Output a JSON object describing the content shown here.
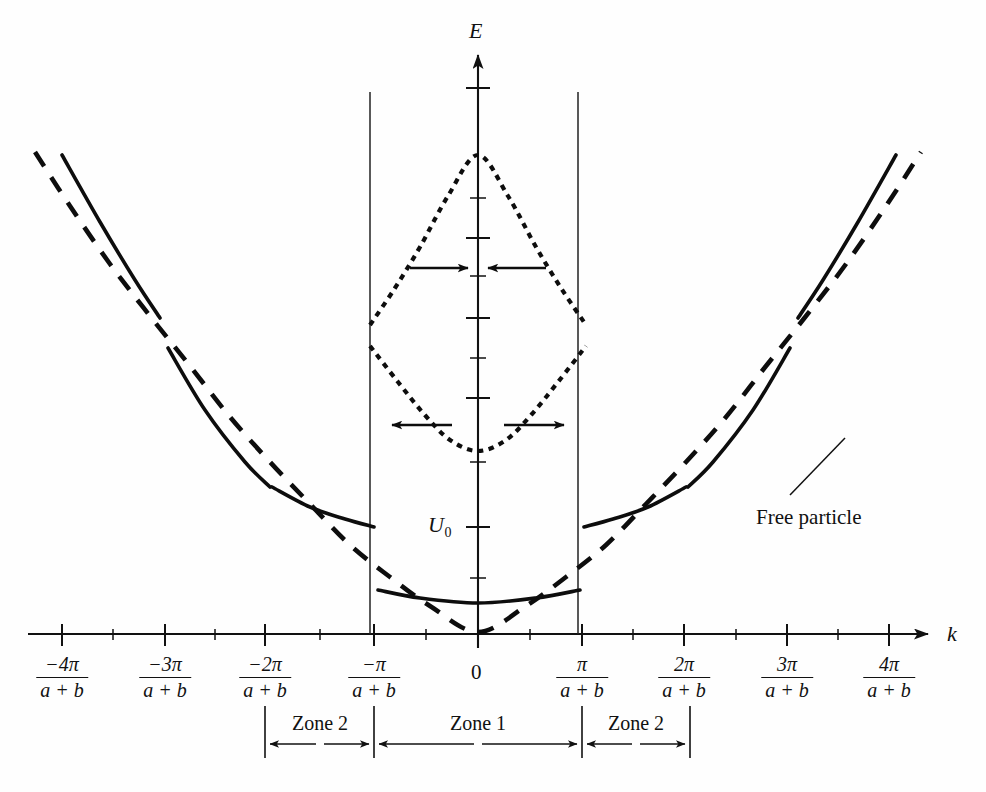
{
  "figure": {
    "kind": "energy-band-diagram",
    "background_color": "#fefefe",
    "ink_color": "#0d0d0d"
  },
  "axes": {
    "y_label": "E",
    "x_label": "k",
    "origin_label": "0",
    "energy_reference_label": "U",
    "energy_reference_subscript": "0"
  },
  "x_ticks": [
    {
      "numerator": "−4π",
      "denominator": "a + b",
      "x": 62
    },
    {
      "numerator": "−3π",
      "denominator": "a + b",
      "x": 165
    },
    {
      "numerator": "−2π",
      "denominator": "a + b",
      "x": 265
    },
    {
      "numerator": "−π",
      "denominator": "a + b",
      "x": 374
    },
    {
      "numerator": "π",
      "denominator": "a + b",
      "x": 582
    },
    {
      "numerator": "2π",
      "denominator": "a + b",
      "x": 684
    },
    {
      "numerator": "3π",
      "denominator": "a + b",
      "x": 787
    },
    {
      "numerator": "4π",
      "denominator": "a + b",
      "x": 889
    }
  ],
  "zones": [
    {
      "label": "Zone 2",
      "start_x": 265,
      "end_x": 374,
      "center_x": 320
    },
    {
      "label": "Zone 1",
      "start_x": 374,
      "end_x": 582,
      "center_x": 478
    },
    {
      "label": "Zone 2",
      "start_x": 582,
      "end_x": 690,
      "center_x": 636
    }
  ],
  "annotations": {
    "free_particle_label": "Free particle",
    "free_particle_label_x": 756,
    "free_particle_label_y": 505,
    "leader_from_x": 790,
    "leader_from_y": 495,
    "leader_to_x": 845,
    "leader_to_y": 438
  },
  "chart_data": {
    "type": "line",
    "title": "",
    "xlabel": "k",
    "ylabel": "E",
    "grid": false,
    "legend": "none",
    "xlim_labels": [
      "-4π/(a+b)",
      "4π/(a+b)"
    ],
    "series": [
      {
        "name": "free-particle-parabola",
        "style": "long-dashed",
        "points": [
          [
            35,
            152
          ],
          [
            70,
            206
          ],
          [
            110,
            264
          ],
          [
            150,
            316
          ],
          [
            190,
            366
          ],
          [
            230,
            417
          ],
          [
            270,
            462
          ],
          [
            310,
            504
          ],
          [
            350,
            545
          ],
          [
            390,
            577
          ],
          [
            430,
            606
          ],
          [
            478,
            632
          ],
          [
            526,
            606
          ],
          [
            566,
            577
          ],
          [
            606,
            545
          ],
          [
            646,
            504
          ],
          [
            686,
            462
          ],
          [
            726,
            417
          ],
          [
            766,
            366
          ],
          [
            806,
            316
          ],
          [
            846,
            264
          ],
          [
            886,
            206
          ],
          [
            921,
            152
          ]
        ]
      },
      {
        "name": "band-3-left",
        "style": "solid",
        "points": [
          [
            62,
            155
          ],
          [
            100,
            222
          ],
          [
            135,
            280
          ],
          [
            160,
            318
          ]
        ]
      },
      {
        "name": "band-2-left",
        "style": "solid",
        "points": [
          [
            168,
            348
          ],
          [
            205,
            410
          ],
          [
            245,
            462
          ],
          [
            270,
            487
          ]
        ]
      },
      {
        "name": "band-1-left",
        "style": "solid",
        "points": [
          [
            272,
            487
          ],
          [
            310,
            507
          ],
          [
            345,
            519
          ],
          [
            374,
            527
          ]
        ]
      },
      {
        "name": "band-0-zone1",
        "style": "solid",
        "points": [
          [
            378,
            590
          ],
          [
            420,
            598
          ],
          [
            478,
            603
          ],
          [
            536,
            598
          ],
          [
            580,
            590
          ]
        ]
      },
      {
        "name": "band-1-right",
        "style": "solid",
        "points": [
          [
            584,
            527
          ],
          [
            613,
            519
          ],
          [
            648,
            507
          ],
          [
            686,
            487
          ]
        ]
      },
      {
        "name": "band-2-right",
        "style": "solid",
        "points": [
          [
            688,
            487
          ],
          [
            713,
            462
          ],
          [
            753,
            410
          ],
          [
            790,
            348
          ]
        ]
      },
      {
        "name": "band-3-right",
        "style": "solid",
        "points": [
          [
            798,
            318
          ],
          [
            823,
            280
          ],
          [
            858,
            222
          ],
          [
            896,
            155
          ]
        ]
      },
      {
        "name": "gap-upper-dotted",
        "style": "short-dotted",
        "points": [
          [
            370,
            325
          ],
          [
            395,
            288
          ],
          [
            420,
            247
          ],
          [
            448,
            196
          ],
          [
            478,
            155
          ],
          [
            508,
            196
          ],
          [
            536,
            247
          ],
          [
            561,
            288
          ],
          [
            586,
            325
          ]
        ]
      },
      {
        "name": "gap-lower-dotted",
        "style": "short-dotted",
        "points": [
          [
            370,
            346
          ],
          [
            398,
            382
          ],
          [
            424,
            414
          ],
          [
            450,
            440
          ],
          [
            478,
            451
          ],
          [
            506,
            440
          ],
          [
            532,
            414
          ],
          [
            558,
            382
          ],
          [
            586,
            346
          ]
        ]
      }
    ],
    "gap_arrows": [
      {
        "name": "upper-left-inward",
        "x1": 410,
        "y1": 268,
        "x2": 468,
        "y2": 268,
        "direction": "right"
      },
      {
        "name": "upper-right-inward",
        "x1": 546,
        "y1": 268,
        "x2": 488,
        "y2": 268,
        "direction": "left"
      },
      {
        "name": "lower-left-outward",
        "x1": 452,
        "y1": 425,
        "x2": 392,
        "y2": 425,
        "direction": "left"
      },
      {
        "name": "lower-right-outward",
        "x1": 504,
        "y1": 425,
        "x2": 564,
        "y2": 425,
        "direction": "right"
      }
    ]
  }
}
